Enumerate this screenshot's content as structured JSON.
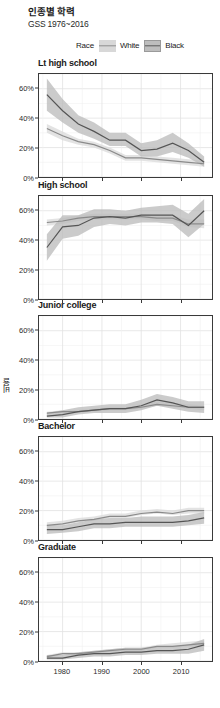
{
  "header": {
    "title": "인종별 학력",
    "subtitle": "GSS 1976~2016"
  },
  "legend": {
    "title": "Race",
    "items": [
      {
        "label": "White",
        "band_color": "#d8d8d8",
        "line_color": "#8e8e8e"
      },
      {
        "label": "Black",
        "band_color": "#bdbdbd",
        "line_color": "#5a5a5a"
      }
    ]
  },
  "axis": {
    "y_title": "비율",
    "y_ticks": [
      "0%",
      "20%",
      "40%",
      "60%"
    ],
    "y_tick_values": [
      0,
      20,
      40,
      60
    ],
    "x_ticks": [
      "1980",
      "1990",
      "2000",
      "2010"
    ],
    "x_tick_values": [
      1980,
      1990,
      2000,
      2010
    ]
  },
  "chart_data": {
    "type": "line",
    "title": "인종별 학력",
    "subtitle": "GSS 1976~2016",
    "xlabel": "",
    "ylabel": "비율",
    "xlim": [
      1974,
      2018
    ],
    "ylim": [
      0,
      70
    ],
    "grid": true,
    "legend_position": "top-right",
    "legend_title": "Race",
    "facet_variable": "degree",
    "x": [
      1976,
      1980,
      1984,
      1988,
      1992,
      1996,
      2000,
      2004,
      2008,
      2012,
      2016
    ],
    "panels": [
      {
        "title": "Lt high school",
        "series": [
          {
            "name": "White",
            "values": [
              33,
              28,
              24,
              22,
              18,
              13,
              13,
              12,
              11,
              10,
              9
            ],
            "lower": [
              30,
              25,
              22,
              20,
              16,
              11,
              11,
              10,
              9,
              8,
              7
            ],
            "upper": [
              36,
              31,
              26,
              24,
              20,
              15,
              15,
              14,
              13,
              12,
              11
            ]
          },
          {
            "name": "Black",
            "values": [
              56,
              45,
              36,
              31,
              25,
              25,
              18,
              19,
              23,
              18,
              10
            ],
            "lower": [
              45,
              37,
              30,
              26,
              21,
              21,
              14,
              14,
              17,
              13,
              7
            ],
            "upper": [
              67,
              53,
              42,
              37,
              30,
              30,
              23,
              25,
              30,
              23,
              14
            ]
          }
        ]
      },
      {
        "title": "High school",
        "series": [
          {
            "name": "White",
            "values": [
              52,
              53,
              55,
              56,
              56,
              56,
              56,
              55,
              55,
              51,
              51
            ],
            "lower": [
              50,
              51,
              53,
              54,
              54,
              54,
              54,
              53,
              53,
              49,
              48
            ],
            "upper": [
              54,
              55,
              57,
              58,
              58,
              58,
              58,
              57,
              57,
              54,
              54
            ]
          },
          {
            "name": "Black",
            "values": [
              35,
              49,
              50,
              55,
              56,
              55,
              57,
              57,
              57,
              50,
              60
            ],
            "lower": [
              26,
              41,
              43,
              49,
              51,
              50,
              52,
              52,
              51,
              42,
              51
            ],
            "upper": [
              44,
              57,
              57,
              61,
              61,
              60,
              62,
              63,
              64,
              58,
              68
            ]
          }
        ]
      },
      {
        "title": "Junior college",
        "series": [
          {
            "name": "White",
            "values": [
              4,
              5,
              5,
              6,
              7,
              7,
              8,
              10,
              9,
              8,
              8
            ],
            "lower": [
              3,
              4,
              4,
              5,
              6,
              6,
              7,
              9,
              8,
              7,
              6
            ],
            "upper": [
              5,
              6,
              6,
              7,
              8,
              8,
              9,
              12,
              11,
              10,
              9
            ]
          },
          {
            "name": "Black",
            "values": [
              2,
              3,
              5,
              6,
              7,
              7,
              9,
              13,
              11,
              8,
              8
            ],
            "lower": [
              1,
              1,
              3,
              4,
              4,
              4,
              6,
              9,
              7,
              5,
              4
            ],
            "upper": [
              4,
              6,
              8,
              9,
              10,
              10,
              13,
              17,
              15,
              12,
              12
            ]
          }
        ]
      },
      {
        "title": "Bachelor",
        "series": [
          {
            "name": "White",
            "values": [
              10,
              11,
              13,
              14,
              16,
              16,
              18,
              19,
              18,
              20,
              20
            ],
            "lower": [
              9,
              10,
              12,
              13,
              15,
              15,
              17,
              18,
              17,
              18,
              18
            ],
            "upper": [
              12,
              13,
              15,
              16,
              18,
              18,
              20,
              21,
              20,
              22,
              22
            ]
          },
          {
            "name": "Black",
            "values": [
              7,
              7,
              9,
              11,
              11,
              12,
              12,
              12,
              12,
              13,
              15
            ],
            "lower": [
              4,
              5,
              6,
              8,
              8,
              9,
              9,
              9,
              9,
              10,
              11
            ],
            "upper": [
              10,
              10,
              12,
              14,
              15,
              15,
              16,
              16,
              16,
              17,
              19
            ]
          }
        ]
      },
      {
        "title": "Graduate",
        "series": [
          {
            "name": "White",
            "values": [
              3,
              5,
              5,
              6,
              7,
              8,
              8,
              10,
              10,
              11,
              12
            ],
            "lower": [
              2,
              4,
              4,
              5,
              6,
              7,
              7,
              9,
              9,
              10,
              10
            ],
            "upper": [
              4,
              6,
              6,
              7,
              8,
              9,
              9,
              11,
              12,
              13,
              14
            ]
          },
          {
            "name": "Black",
            "values": [
              2,
              2,
              4,
              5,
              5,
              6,
              6,
              7,
              7,
              8,
              11
            ],
            "lower": [
              1,
              1,
              2,
              3,
              3,
              4,
              4,
              5,
              5,
              5,
              7
            ],
            "upper": [
              4,
              4,
              6,
              7,
              8,
              9,
              9,
              10,
              10,
              11,
              15
            ]
          }
        ]
      }
    ]
  }
}
